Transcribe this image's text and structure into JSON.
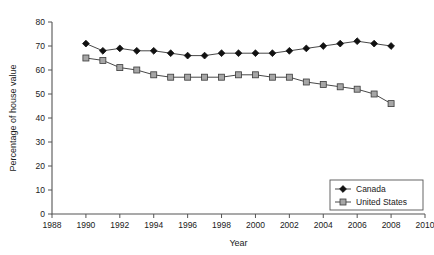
{
  "chart_data": {
    "type": "line",
    "title": "",
    "xlabel": "Year",
    "ylabel": "Percentage of house value",
    "xlim": [
      1988,
      2010
    ],
    "ylim": [
      0,
      80
    ],
    "xticks": [
      1988,
      1990,
      1992,
      1994,
      1996,
      1998,
      2000,
      2002,
      2004,
      2006,
      2008,
      2010
    ],
    "yticks": [
      0,
      10,
      20,
      30,
      40,
      50,
      60,
      70,
      80
    ],
    "grid": false,
    "legend_position": "bottom-right",
    "x": [
      1990,
      1991,
      1992,
      1993,
      1994,
      1995,
      1996,
      1997,
      1998,
      1999,
      2000,
      2001,
      2002,
      2003,
      2004,
      2005,
      2006,
      2007,
      2008
    ],
    "series": [
      {
        "name": "Canada",
        "marker": "filled-diamond",
        "color": "#111111",
        "values": [
          71,
          68,
          69,
          68,
          68,
          67,
          66,
          66,
          67,
          67,
          67,
          67,
          68,
          69,
          70,
          71,
          72,
          71,
          70
        ]
      },
      {
        "name": "United States",
        "marker": "open-square",
        "color": "#a6a6a6",
        "values": [
          65,
          64,
          61,
          60,
          58,
          57,
          57,
          57,
          57,
          58,
          58,
          57,
          57,
          55,
          54,
          53,
          52,
          50,
          46
        ]
      }
    ]
  },
  "legend": {
    "entries": [
      {
        "label": "Canada",
        "marker": "filled-diamond"
      },
      {
        "label": "United States",
        "marker": "open-square"
      }
    ]
  },
  "axes": {
    "x_title": "Year",
    "y_title": "Percentage of house value"
  }
}
